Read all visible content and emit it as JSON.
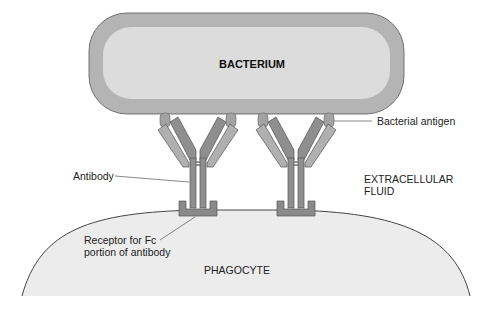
{
  "diagram": {
    "type": "opsonization by antibody",
    "labels": {
      "bacterium": "BACTERIUM",
      "bacterial_antigen": "Bacterial antigen",
      "antibody": "Antibody",
      "extracellular_fluid_line1": "EXTRACELLULAR",
      "extracellular_fluid_line2": "FLUID",
      "receptor_line1": "Receptor for Fc",
      "receptor_line2": "portion of antibody",
      "phagocyte": "PHAGOCYTE"
    },
    "colors": {
      "bacterium_outer": "#b4b4b4",
      "bacterium_inner": "#dcdcdc",
      "antibody_heavy": "#8f8f8f",
      "antibody_light": "#b0b0b0",
      "antigen": "#a2a2a2",
      "receptor": "#8a8a8a",
      "phagocyte_fill": "#ececec",
      "outline": "#444444"
    }
  }
}
